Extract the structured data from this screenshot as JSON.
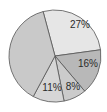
{
  "chart_data": {
    "type": "pie",
    "title": "",
    "start_angle_deg": -15,
    "slices": [
      {
        "label": "27%",
        "value": 27,
        "color": "#e6e6e6",
        "label_pos": [
          80,
          28
        ]
      },
      {
        "label": "16%",
        "value": 16,
        "color": "#b8b8b8",
        "label_pos": [
          88,
          67
        ]
      },
      {
        "label": "8%",
        "value": 8,
        "color": "#cbcbcb",
        "label_pos": [
          73,
          90
        ]
      },
      {
        "label": "11%",
        "value": 11,
        "color": "#d6d6d6",
        "label_pos": [
          52,
          91
        ]
      },
      {
        "label": "",
        "value": 38,
        "color": "#c9c9c9",
        "label_pos": [
          30,
          55
        ]
      }
    ],
    "center": [
      55,
      56
    ],
    "radius": 46
  }
}
